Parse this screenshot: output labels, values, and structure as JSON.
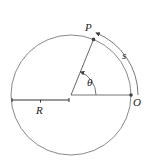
{
  "diagram": {
    "labels": {
      "point_p": "P",
      "point_o": "O",
      "arc": "s",
      "angle": "θ",
      "radius": "R"
    },
    "colors": {
      "stroke": "#555555",
      "circle": "#8a8a8a",
      "dot": "#444444",
      "text": "#222222"
    },
    "geometry": {
      "center": [
        71,
        95
      ],
      "radius": 60,
      "angle_deg": 68,
      "arc_offset_radius": 67
    }
  }
}
